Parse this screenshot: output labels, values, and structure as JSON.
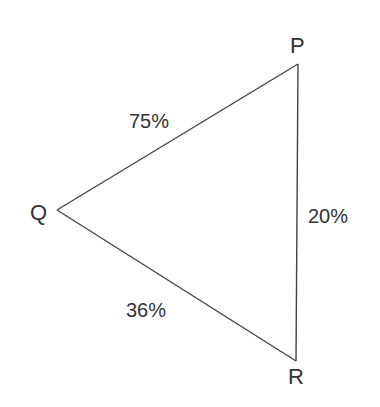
{
  "diagram": {
    "type": "triangle",
    "line_color": "#444444",
    "text_color": "#333333",
    "vertices": {
      "P": {
        "label": "P",
        "x": 298,
        "y": 64
      },
      "Q": {
        "label": "Q",
        "x": 57,
        "y": 210
      },
      "R": {
        "label": "R",
        "x": 296,
        "y": 361
      }
    },
    "edges": {
      "PQ": {
        "from": "P",
        "to": "Q",
        "label": "75%"
      },
      "PR": {
        "from": "P",
        "to": "R",
        "label": "20%"
      },
      "QR": {
        "from": "Q",
        "to": "R",
        "label": "36%"
      }
    }
  }
}
